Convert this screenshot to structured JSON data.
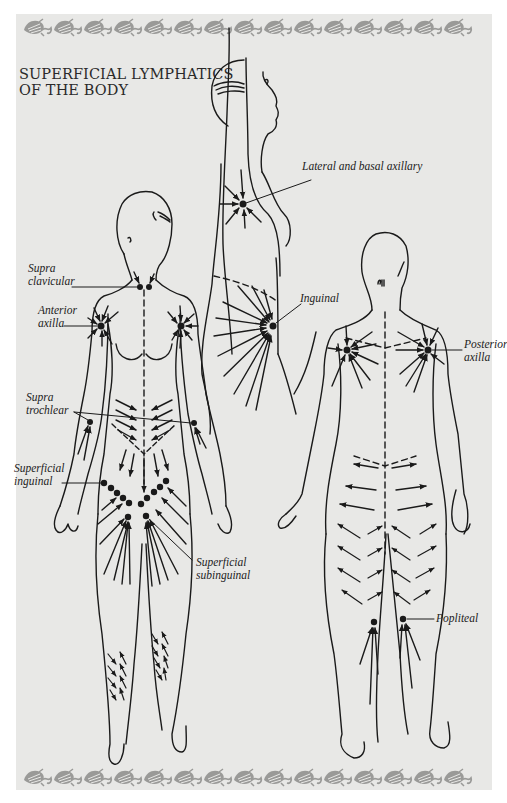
{
  "title": {
    "line1": "SUPERFICIAL LYMPHATICS",
    "line2": "OF THE BODY"
  },
  "colors": {
    "background": "#e8e8e6",
    "ink": "#1a1a1a",
    "border_motif": "#9a9a98"
  },
  "figures": [
    {
      "name": "side-view",
      "description": "Lateral view with raised arm"
    },
    {
      "name": "front-view",
      "description": "Anterior view of female body"
    },
    {
      "name": "back-view",
      "description": "Posterior view of female body"
    }
  ],
  "labels": {
    "lateral_basal_axillary": "Lateral and basal axillary",
    "inguinal": "Inguinal",
    "supra_clavicular_1": "Supra",
    "supra_clavicular_2": "clavicular",
    "anterior_axilla_1": "Anterior",
    "anterior_axilla_2": "axilla",
    "supra_trochlear_1": "Supra",
    "supra_trochlear_2": "trochlear",
    "superficial_inguinal_1": "Superficial",
    "superficial_inguinal_2": "inguinal",
    "superficial_subinguinal_1": "Superficial",
    "superficial_subinguinal_2": "subinguinal",
    "posterior_axilla_1": "Posterior",
    "posterior_axilla_2": "axilla",
    "popliteal": "Popliteal"
  },
  "border": {
    "motif": "leaf-scroll",
    "repeat_count": 15
  }
}
